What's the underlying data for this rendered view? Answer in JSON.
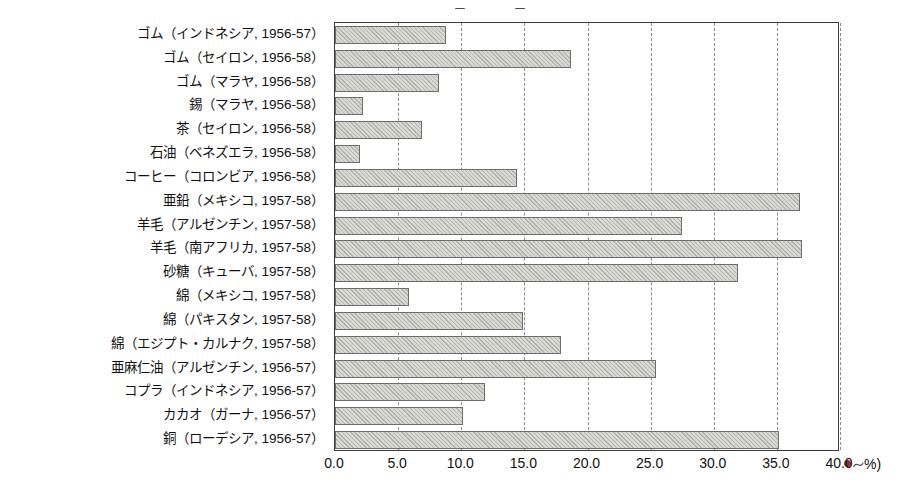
{
  "chart_data": {
    "type": "bar",
    "orientation": "horizontal",
    "title": "",
    "xlabel": "(%)",
    "ylabel": "",
    "xlim": [
      0,
      40
    ],
    "xticks": [
      "0.0",
      "5.0",
      "10.0",
      "15.0",
      "20.0",
      "25.0",
      "30.0",
      "35.0",
      "40.0"
    ],
    "xtick_values": [
      0,
      5,
      10,
      15,
      20,
      25,
      30,
      35,
      40
    ],
    "grid": true,
    "legend": "none",
    "unit_suffix": "%)",
    "categories": [
      "ゴム（インドネシア, 1956-57）",
      "ゴム（セイロン, 1956-58）",
      "ゴム（マラヤ, 1956-58）",
      "錫（マラヤ, 1956-58）",
      "茶（セイロン, 1956-58）",
      "石油（ベネズエラ, 1956-58）",
      "コーヒー（コロンビア, 1956-58）",
      "亜鉛（メキシコ, 1957-58）",
      "羊毛（アルゼンチン, 1957-58）",
      "羊毛（南アフリカ, 1957-58）",
      "砂糖（キューバ, 1957-58）",
      "綿（メキシコ, 1957-58）",
      "綿（パキスタン, 1957-58）",
      "綿（エジプト・カルナク, 1957-58）",
      "亜麻仁油（アルゼンチン, 1956-57）",
      "コプラ（インドネシア, 1956-57）",
      "カカオ（ガーナ, 1956-57）",
      "銅（ローデシア, 1956-57）"
    ],
    "values": [
      8.8,
      18.7,
      8.2,
      2.2,
      6.9,
      2.0,
      14.4,
      36.8,
      27.5,
      37.0,
      31.9,
      5.9,
      14.9,
      17.9,
      25.4,
      11.9,
      10.1,
      35.2
    ]
  },
  "top_fragments": [
    "ー",
    "ー"
  ]
}
